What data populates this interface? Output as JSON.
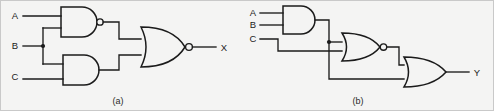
{
  "figure": {
    "background_color": "#f4f4f3",
    "line_color": "#1b1b1b",
    "captions": {
      "a": "(a)",
      "b": "(b)"
    }
  },
  "circuit_a": {
    "caption": "(a)",
    "inputs": [
      {
        "label": "A",
        "goes_to": [
          "nand-gate"
        ]
      },
      {
        "label": "B",
        "goes_to": [
          "nand-gate",
          "and-gate"
        ],
        "has_junction_dot": true
      },
      {
        "label": "C",
        "goes_to": [
          "and-gate"
        ]
      }
    ],
    "gates": [
      {
        "name": "nand-gate",
        "type": "NAND",
        "inputs": [
          "A",
          "B"
        ],
        "inverted_output": true
      },
      {
        "name": "and-gate",
        "type": "AND",
        "inputs": [
          "B",
          "C"
        ],
        "inverted_output": false
      },
      {
        "name": "nor-gate",
        "type": "NOR",
        "inputs": [
          "nand-gate",
          "and-gate"
        ],
        "inverted_output": true
      }
    ],
    "output": {
      "label": "X",
      "from": "nor-gate"
    }
  },
  "circuit_b": {
    "caption": "(b)",
    "inputs": [
      {
        "label": "A",
        "goes_to": [
          "and-gate"
        ]
      },
      {
        "label": "B",
        "goes_to": [
          "and-gate"
        ]
      },
      {
        "label": "C",
        "goes_to": [
          "nor-gate"
        ]
      }
    ],
    "gates": [
      {
        "name": "and-gate",
        "type": "AND",
        "inputs": [
          "A",
          "B"
        ],
        "inverted_output": false,
        "has_junction_dot": true
      },
      {
        "name": "nor-gate",
        "type": "NOR",
        "inputs": [
          "and-gate",
          "C"
        ],
        "inverted_output": true
      },
      {
        "name": "or-gate",
        "type": "OR",
        "inputs": [
          "and-gate",
          "nor-gate"
        ],
        "inverted_output": false
      }
    ],
    "output": {
      "label": "Y",
      "from": "or-gate"
    }
  }
}
